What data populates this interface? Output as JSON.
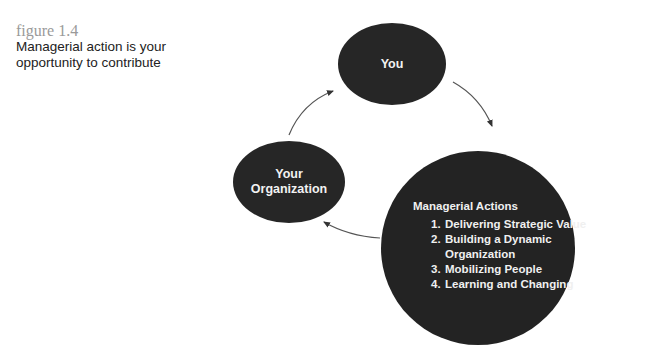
{
  "caption": {
    "figure_number": "figure 1.4",
    "title": "Managerial action is your opportunity to contribute"
  },
  "diagram": {
    "nodes": {
      "you": {
        "label": "You"
      },
      "organization": {
        "label_line1": "Your",
        "label_line2": "Organization"
      },
      "actions": {
        "heading": "Managerial Actions",
        "items": [
          {
            "num": "1.",
            "text": "Delivering Strategic Value"
          },
          {
            "num": "2.",
            "text": "Building a Dynamic Organization"
          },
          {
            "num": "3.",
            "text": "Mobilizing People"
          },
          {
            "num": "4.",
            "text": "Learning and Changing"
          }
        ]
      }
    },
    "flow": [
      "You",
      "Managerial Actions",
      "Your Organization",
      "You"
    ],
    "colors": {
      "node_fill": "#262626",
      "node_text": "#f0f0f0",
      "arrow": "#555555",
      "caption_number": "#9a9a9a"
    }
  }
}
